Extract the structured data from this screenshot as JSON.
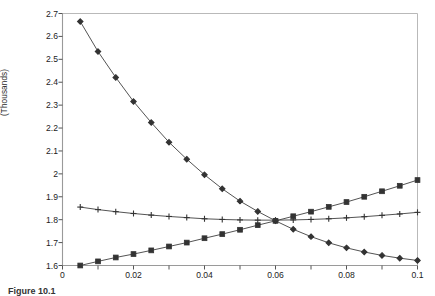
{
  "figure": {
    "caption": "Figure 10.1"
  },
  "axes": {
    "y_title": "(Thousands)",
    "y_ticks": [
      "1.6",
      "1.7",
      "1.8",
      "1.9",
      "2",
      "2.1",
      "2.2",
      "2.3",
      "2.4",
      "2.5",
      "2.6",
      "2.7"
    ],
    "x_ticks": [
      "0",
      "0.02",
      "0.04",
      "0.06",
      "0.08",
      "0.1"
    ]
  },
  "chart_data": {
    "type": "line",
    "title": "",
    "xlabel": "",
    "ylabel": "(Thousands)",
    "xlim": [
      0,
      0.1
    ],
    "ylim": [
      1.6,
      2.7
    ],
    "ytick_values": [
      1.6,
      1.7,
      1.8,
      1.9,
      2.0,
      2.1,
      2.2,
      2.3,
      2.4,
      2.5,
      2.6,
      2.7
    ],
    "xtick_values": [
      0,
      0.02,
      0.04,
      0.06,
      0.08,
      0.1
    ],
    "xtick_minor_step": 0.01,
    "grid": false,
    "legend": "none",
    "x": [
      0.005,
      0.01,
      0.015,
      0.02,
      0.025,
      0.03,
      0.035,
      0.04,
      0.045,
      0.05,
      0.055,
      0.06,
      0.065,
      0.07,
      0.075,
      0.08,
      0.085,
      0.09,
      0.095,
      0.1
    ],
    "series": [
      {
        "name": "declining",
        "marker": "diamond",
        "values": [
          2.665,
          2.534,
          2.421,
          2.316,
          2.224,
          2.138,
          2.064,
          1.996,
          1.935,
          1.881,
          1.836,
          1.795,
          1.758,
          1.726,
          1.699,
          1.677,
          1.659,
          1.644,
          1.632,
          1.622
        ]
      },
      {
        "name": "rising",
        "marker": "square",
        "values": [
          1.6,
          1.618,
          1.635,
          1.65,
          1.666,
          1.683,
          1.7,
          1.719,
          1.737,
          1.756,
          1.776,
          1.795,
          1.815,
          1.835,
          1.856,
          1.877,
          1.9,
          1.924,
          1.948,
          1.973
        ]
      },
      {
        "name": "flat",
        "marker": "plus",
        "values": [
          1.855,
          1.844,
          1.835,
          1.827,
          1.82,
          1.814,
          1.809,
          1.804,
          1.801,
          1.799,
          1.798,
          1.798,
          1.799,
          1.801,
          1.804,
          1.808,
          1.813,
          1.819,
          1.825,
          1.832
        ]
      }
    ]
  },
  "style": {
    "frame_color": "#9a9a9a",
    "line_color": "#4a4a4a",
    "marker_color": "#333333",
    "tick_color": "#555555"
  }
}
